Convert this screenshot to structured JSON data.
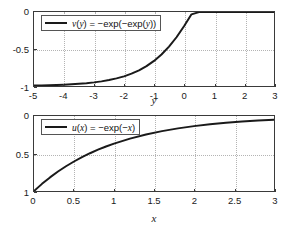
{
  "chart_data": [
    {
      "type": "line",
      "title": "",
      "xlabel": "y",
      "ylabel": "",
      "xlim": [
        -5,
        3
      ],
      "ylim": [
        -1,
        0
      ],
      "y_inverted": false,
      "grid": true,
      "legend_position": "top-left",
      "xticks": [
        "-5",
        "-4",
        "-3",
        "-2",
        "-1",
        "0",
        "1",
        "2",
        "3"
      ],
      "xtick_values": [
        -5,
        -4,
        -3,
        -2,
        -1,
        0,
        1,
        2,
        3
      ],
      "yticks": [
        "0",
        "-0.5",
        "-1"
      ],
      "ytick_values": [
        0,
        -0.5,
        -1
      ],
      "series": [
        {
          "name": "v(y) = -exp(-exp(y))",
          "legend_label_plain": "v(y) = −exp(−exp(y))",
          "color": "#1a1a1a",
          "linewidth": 2,
          "x": [
            -5,
            -4.75,
            -4.5,
            -4.25,
            -4,
            -3.75,
            -3.5,
            -3.25,
            -3,
            -2.75,
            -2.5,
            -2.25,
            -2,
            -1.75,
            -1.5,
            -1.25,
            -1,
            -0.75,
            -0.5,
            -0.25,
            0,
            0.25,
            0.5,
            0.75,
            1,
            1.25,
            1.5,
            1.75,
            2,
            2.25,
            2.5,
            2.75,
            3
          ],
          "y": [
            -0.99328,
            -0.99139,
            -0.98896,
            -0.98584,
            -0.98184,
            -0.97672,
            -0.97016,
            -0.96177,
            -0.95103,
            -0.93731,
            -0.91978,
            -0.89747,
            -0.86913,
            -0.83327,
            -0.78806,
            -0.73138,
            -0.66082,
            -0.57377,
            -0.46779,
            -0.341,
            -0.1923,
            -0.03168,
            -0.0019,
            -0.0,
            -0.0,
            -0.0,
            -0.0,
            -0.0,
            -0.0,
            -0.0,
            -0.0,
            -0.0,
            -0.0
          ]
        }
      ]
    },
    {
      "type": "line",
      "title": "",
      "xlabel": "x",
      "ylabel": "",
      "xlim": [
        0,
        3
      ],
      "ylim": [
        0,
        1
      ],
      "y_inverted": true,
      "grid": true,
      "legend_position": "top-left",
      "xticks": [
        "0",
        "0.5",
        "1",
        "1.5",
        "2",
        "2.5",
        "3"
      ],
      "xtick_values": [
        0,
        0.5,
        1,
        1.5,
        2,
        2.5,
        3
      ],
      "yticks": [
        "0",
        "0.5",
        "1"
      ],
      "ytick_values": [
        0,
        0.5,
        1
      ],
      "series": [
        {
          "name": "u(x) = -exp(-x)",
          "legend_label_plain": "u(x) = −exp(−x)",
          "color": "#1a1a1a",
          "linewidth": 2,
          "x": [
            0,
            0.1,
            0.2,
            0.3,
            0.4,
            0.5,
            0.6,
            0.7,
            0.8,
            0.9,
            1.0,
            1.2,
            1.4,
            1.6,
            1.8,
            2.0,
            2.2,
            2.4,
            2.6,
            2.8,
            3.0
          ],
          "y": [
            1.0,
            0.90484,
            0.81873,
            0.74082,
            0.67032,
            0.60653,
            0.54881,
            0.49659,
            0.44933,
            0.40657,
            0.36788,
            0.30119,
            0.2466,
            0.2019,
            0.1653,
            0.13534,
            0.1108,
            0.09072,
            0.07427,
            0.06081,
            0.04979
          ]
        }
      ]
    }
  ],
  "top_plot": {
    "legend": {
      "prefix": "v",
      "arg_open": "(",
      "arg": "y",
      "arg_close": ")",
      "eq": " = −exp(−exp(",
      "arg2": "y",
      "tail": "))"
    },
    "xlabel": "y",
    "xticks": [
      "-5",
      "-4",
      "-3",
      "-2",
      "-1",
      "0",
      "1",
      "2",
      "3"
    ],
    "yticks": [
      "0",
      "-0.5",
      "-1"
    ]
  },
  "bottom_plot": {
    "legend": {
      "prefix": "u",
      "arg_open": "(",
      "arg": "x",
      "arg_close": ")",
      "eq": " = −exp(−",
      "arg2": "x",
      "tail": ")"
    },
    "xlabel": "x",
    "xticks": [
      "0",
      "0.5",
      "1",
      "1.5",
      "2",
      "2.5",
      "3"
    ],
    "yticks": [
      "0",
      "0.5",
      "1"
    ]
  },
  "style": {
    "curve_color": "#1a1a1a",
    "axis_color": "#3a3a3a",
    "grid_color": "#b4b4b4",
    "background": "#ffffff"
  }
}
